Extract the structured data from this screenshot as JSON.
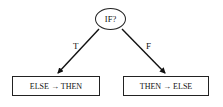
{
  "diagram": {
    "type": "decision-flow",
    "decision": {
      "label": "IF?"
    },
    "branches": [
      {
        "label": "T",
        "target": "ELSE → THEN"
      },
      {
        "label": "F",
        "target": "THEN → ELSE"
      }
    ]
  }
}
